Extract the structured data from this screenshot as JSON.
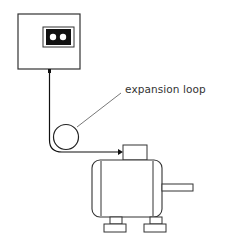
{
  "diagram": {
    "labels": {
      "expansion_loop": "expansion loop"
    },
    "components": [
      "control-box",
      "connector",
      "cable",
      "expansion-loop",
      "motor",
      "terminal-box",
      "shaft",
      "feet"
    ],
    "colors": {
      "stroke": "#222222",
      "connector_fill": "#111111",
      "background": "#ffffff"
    }
  }
}
